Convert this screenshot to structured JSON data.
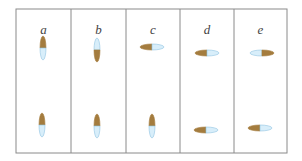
{
  "diagram": {
    "title": "",
    "colors": {
      "frame": "#8a8a8a",
      "brown": "#a47c3e",
      "blue": "#d8eefa",
      "blue_outline": "#8fc3e0",
      "label": "#444444"
    },
    "columns": [
      {
        "label": "a",
        "capsules": [
          {
            "row": "top",
            "orientation": "vertical",
            "brown_end": "top"
          },
          {
            "row": "bottom",
            "orientation": "vertical",
            "brown_end": "top"
          }
        ]
      },
      {
        "label": "b",
        "capsules": [
          {
            "row": "top",
            "orientation": "vertical",
            "brown_end": "bottom"
          },
          {
            "row": "bottom",
            "orientation": "vertical",
            "brown_end": "top"
          }
        ]
      },
      {
        "label": "c",
        "capsules": [
          {
            "row": "top",
            "orientation": "horizontal",
            "brown_end": "left"
          },
          {
            "row": "bottom",
            "orientation": "vertical",
            "brown_end": "top"
          }
        ]
      },
      {
        "label": "d",
        "capsules": [
          {
            "row": "top",
            "orientation": "horizontal",
            "brown_end": "left"
          },
          {
            "row": "bottom",
            "orientation": "horizontal",
            "brown_end": "left"
          }
        ]
      },
      {
        "label": "e",
        "capsules": [
          {
            "row": "top",
            "orientation": "horizontal",
            "brown_end": "right"
          },
          {
            "row": "bottom",
            "orientation": "horizontal",
            "brown_end": "left"
          }
        ]
      }
    ]
  }
}
